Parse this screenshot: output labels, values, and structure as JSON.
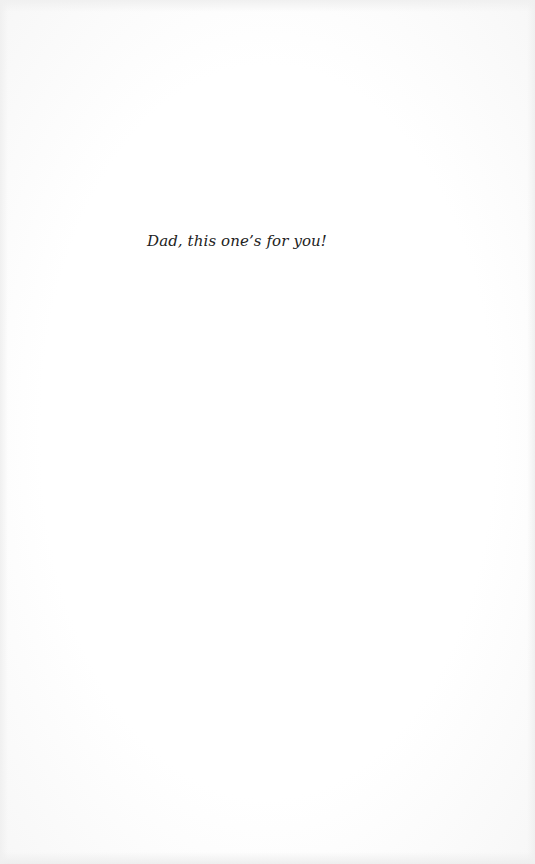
{
  "page": {
    "dedication": "Dad, this one’s for you!"
  },
  "colors": {
    "background": "#fdfdfd",
    "text": "#222222"
  }
}
